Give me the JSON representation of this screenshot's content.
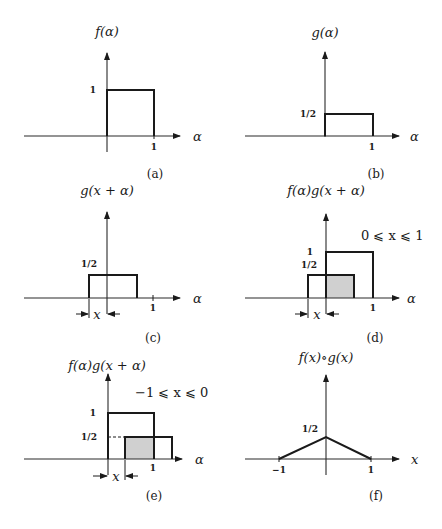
{
  "panels": {
    "a": {
      "title": "f(α)",
      "caption": "(a)",
      "axis_label": "α",
      "y_tick": "1",
      "x_tick": "1"
    },
    "b": {
      "title": "g(α)",
      "caption": "(b)",
      "axis_label": "α",
      "y_tick": "1/2",
      "x_tick": "1"
    },
    "c": {
      "title": "g(x + α)",
      "caption": "(c)",
      "axis_label": "α",
      "y_tick": "1/2",
      "x_tick": "1",
      "shift_label": "x"
    },
    "d": {
      "title": "f(α)g(x + α)",
      "caption": "(d)",
      "axis_label": "α",
      "y_tick_high": "1",
      "y_tick_low": "1/2",
      "x_tick": "1",
      "shift_label": "x",
      "condition": "0 ⩽ x ⩽ 1"
    },
    "e": {
      "title": "f(α)g(x + α)",
      "caption": "(e)",
      "axis_label": "α",
      "y_tick_high": "1",
      "y_tick_low": "1/2",
      "x_tick": "1",
      "shift_label": "x",
      "condition": "−1 ⩽ x ⩽ 0"
    },
    "f": {
      "title": "f(x)∘g(x)",
      "caption": "(f)",
      "axis_label": "x",
      "y_tick": "1/2",
      "x_tick_neg": "−1",
      "x_tick_pos": "1"
    }
  }
}
